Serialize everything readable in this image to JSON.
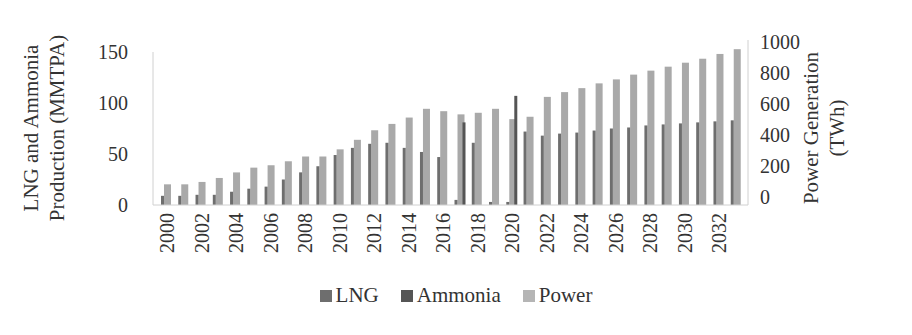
{
  "chart_data": {
    "type": "bar",
    "title": "",
    "xlabel": "",
    "ylabel": "LNG and Ammonia Production (MMTPA)",
    "y2label": "Power Generation (TWh)",
    "ylim": [
      0,
      150
    ],
    "y2lim": [
      0,
      1000
    ],
    "yticks": [
      0,
      50,
      100,
      150
    ],
    "y2ticks": [
      0,
      200,
      400,
      600,
      800,
      1000
    ],
    "xtick_labels": [
      "2000",
      "2002",
      "2004",
      "2006",
      "2008",
      "2010",
      "2012",
      "2014",
      "2016",
      "2018",
      "2020",
      "2022",
      "2024",
      "2026",
      "2028",
      "2030",
      "2032"
    ],
    "grid": false,
    "legend_position": "bottom",
    "categories": [
      "2000",
      "2001",
      "2002",
      "2003",
      "2004",
      "2005",
      "2006",
      "2007",
      "2008",
      "2009",
      "2010",
      "2011",
      "2012",
      "2013",
      "2014",
      "2015",
      "2016",
      "2017",
      "2018",
      "2019",
      "2020",
      "2021",
      "2022",
      "2023",
      "2024",
      "2025",
      "2026",
      "2027",
      "2028",
      "2029",
      "2030",
      "2031",
      "2032",
      "2033"
    ],
    "series": [
      {
        "name": "LNG",
        "axis": "left",
        "color": "#6e6e6e",
        "values": [
          9,
          9,
          10,
          10,
          13,
          16,
          18,
          25,
          32,
          38,
          49,
          56,
          60,
          61,
          56,
          52,
          47,
          5,
          61,
          3,
          3,
          72,
          68,
          70,
          71,
          73,
          75,
          76,
          78,
          79,
          80,
          81,
          82,
          83
        ]
      },
      {
        "name": "Ammonia",
        "axis": "left",
        "color": "#555555",
        "values": [
          0,
          0,
          0,
          0,
          0,
          0,
          0,
          0,
          0,
          0,
          0,
          0,
          0,
          0,
          0,
          0,
          0,
          81,
          0,
          0,
          107,
          0,
          0,
          0,
          0,
          0,
          0,
          0,
          0,
          0,
          0,
          0,
          0,
          0
        ]
      },
      {
        "name": "Power",
        "axis": "right",
        "color": "#a9a9a9",
        "values": [
          130,
          130,
          145,
          170,
          205,
          235,
          250,
          275,
          305,
          305,
          350,
          410,
          470,
          510,
          550,
          605,
          590,
          570,
          580,
          605,
          540,
          555,
          680,
          710,
          735,
          765,
          790,
          820,
          845,
          870,
          895,
          920,
          950,
          980
        ]
      }
    ]
  },
  "legend": {
    "items": [
      {
        "label": "LNG",
        "color": "#6e6e6e"
      },
      {
        "label": "Ammonia",
        "color": "#555555"
      },
      {
        "label": "Power",
        "color": "#b5b5b5"
      }
    ]
  }
}
